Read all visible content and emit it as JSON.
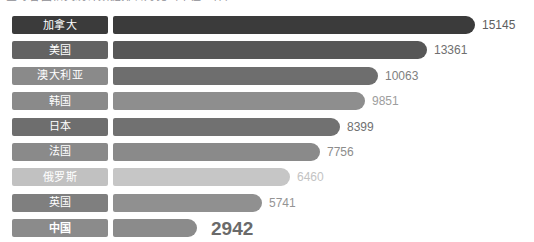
{
  "headline": "全球各国相关统计数据排名对比（单位：件）",
  "chart_data": {
    "type": "bar",
    "orientation": "horizontal",
    "title": "",
    "xlabel": "",
    "ylabel": "",
    "grid": false,
    "legend": "none",
    "categories": [
      "加拿大",
      "美国",
      "澳大利亚",
      "韩国",
      "日本",
      "法国",
      "俄罗斯",
      "英国",
      "中国"
    ],
    "values": [
      15145,
      13361,
      10063,
      9851,
      8399,
      7756,
      6460,
      5741,
      2942
    ],
    "value_labels": [
      "15145",
      "13361",
      "10063",
      "9851",
      "8399",
      "7756",
      "6460",
      "5741",
      "2942"
    ],
    "bar_colors": [
      "#3b3b3b",
      "#575757",
      "#6e6e6e",
      "#8e8e8e",
      "#717171",
      "#8a8a8a",
      "#c6c6c6",
      "#909090",
      "#8b8b8b"
    ],
    "label_box_colors": [
      "#3b3b3b",
      "#636363",
      "#8a8a8a",
      "#8a8a8a",
      "#6e6e6e",
      "#8a8a8a",
      "#c1c1c1",
      "#7f7f7f",
      "#8b8b8b"
    ],
    "bar_pixel_lengths": [
      362,
      314,
      265,
      252,
      227,
      207,
      177,
      149,
      84
    ],
    "value_label_colors": [
      "#5e5e5e",
      "#6f6f6f",
      "#808080",
      "#9d9d9d",
      "#707070",
      "#8c8c8c",
      "#c3c3c3",
      "#949494",
      "#6a6a6a"
    ],
    "highlight_index": 8
  },
  "rows": [
    {
      "label": "加拿大",
      "value": "15145"
    },
    {
      "label": "美国",
      "value": "13361"
    },
    {
      "label": "澳大利亚",
      "value": "10063"
    },
    {
      "label": "韩国",
      "value": "9851"
    },
    {
      "label": "日本",
      "value": "8399"
    },
    {
      "label": "法国",
      "value": "7756"
    },
    {
      "label": "俄罗斯",
      "value": "6460"
    },
    {
      "label": "英国",
      "value": "5741"
    },
    {
      "label": "中国",
      "value": "2942"
    }
  ]
}
